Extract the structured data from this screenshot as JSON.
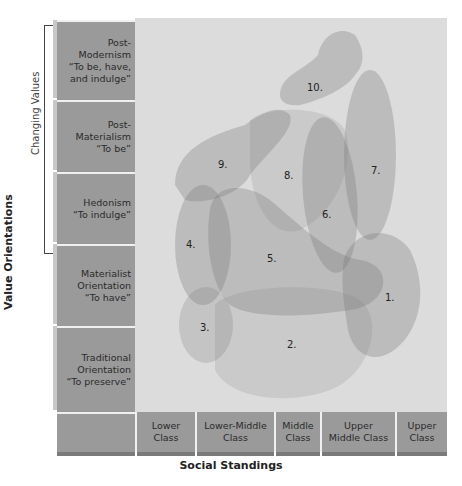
{
  "y_axis": {
    "title": "Value Orientations",
    "bracket_label": "Changing Values",
    "rows": [
      {
        "label_lines": [
          "Post-",
          "Modernism",
          "“To be, have,",
          "and indulge”"
        ]
      },
      {
        "label_lines": [
          "Post-",
          "Materialism",
          "“To be”"
        ]
      },
      {
        "label_lines": [
          "Hedonism",
          "“To indulge”"
        ]
      },
      {
        "label_lines": [
          "Materialist",
          "Orientation",
          "“To have”"
        ]
      },
      {
        "label_lines": [
          "Traditional",
          "Orientation",
          "“To preserve”"
        ]
      }
    ]
  },
  "x_axis": {
    "title": "Social Standings",
    "columns": [
      {
        "label_lines": [
          "Lower",
          "Class"
        ]
      },
      {
        "label_lines": [
          "Lower-Middle",
          "Class"
        ]
      },
      {
        "label_lines": [
          "Middle",
          "Class"
        ]
      },
      {
        "label_lines": [
          "Upper",
          "Middle Class"
        ]
      },
      {
        "label_lines": [
          "Upper",
          "Class"
        ]
      }
    ]
  },
  "segments": [
    {
      "id": "1.",
      "label": "1."
    },
    {
      "id": "2.",
      "label": "2."
    },
    {
      "id": "3.",
      "label": "3."
    },
    {
      "id": "4.",
      "label": "4."
    },
    {
      "id": "5.",
      "label": "5."
    },
    {
      "id": "6.",
      "label": "6."
    },
    {
      "id": "7.",
      "label": "7."
    },
    {
      "id": "8.",
      "label": "8."
    },
    {
      "id": "9.",
      "label": "9."
    },
    {
      "id": "10.",
      "label": "10."
    }
  ],
  "colors": {
    "plot_bg": "#dcdcdc",
    "label_bg": "#9a9a9a",
    "blob_fill": "#808080"
  }
}
